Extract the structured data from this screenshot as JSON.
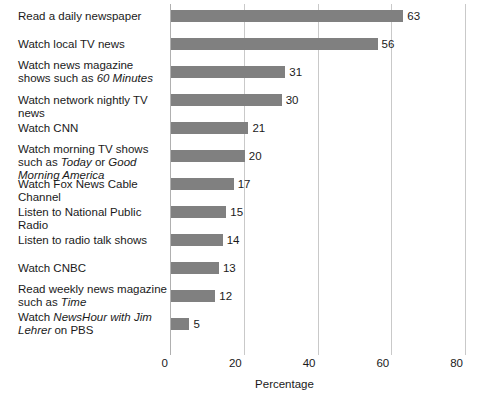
{
  "chart_data": {
    "type": "bar",
    "orientation": "horizontal",
    "title": "",
    "xlabel": "Percentage",
    "ylabel": "",
    "xlim": [
      0,
      80
    ],
    "xticks": [
      0,
      20,
      40,
      60,
      80
    ],
    "grid": true,
    "legend": false,
    "bar_color": "#808080",
    "categories": [
      "Read a daily newspaper",
      "Watch local TV news",
      "Watch news magazine shows such as 60 Minutes",
      "Watch network nightly TV news",
      "Watch CNN",
      "Watch morning TV shows such as Today or Good Morning America",
      "Watch Fox News Cable Channel",
      "Listen to National Public Radio",
      "Listen to radio talk shows",
      "Watch CNBC",
      "Read weekly news magazine such as Time",
      "Watch NewsHour with Jim Lehrer on PBS"
    ],
    "values": [
      63,
      56,
      31,
      30,
      21,
      20,
      17,
      15,
      14,
      13,
      12,
      5
    ],
    "bars": [
      {
        "value": 63,
        "value_label": "63",
        "label_html": "Read a daily newspaper",
        "lines": 1
      },
      {
        "value": 56,
        "value_label": "56",
        "label_html": "Watch local TV news",
        "lines": 1
      },
      {
        "value": 31,
        "value_label": "31",
        "label_html": "Watch news magazine shows such as <em>60 Minutes</em>",
        "lines": 2
      },
      {
        "value": 30,
        "value_label": "30",
        "label_html": "Watch network nightly TV news",
        "lines": 1
      },
      {
        "value": 21,
        "value_label": "21",
        "label_html": "Watch CNN",
        "lines": 1
      },
      {
        "value": 20,
        "value_label": "20",
        "label_html": "Watch morning TV shows such as <em>Today</em> or <em>Good Morning America</em>",
        "lines": 2
      },
      {
        "value": 17,
        "value_label": "17",
        "label_html": "Watch Fox News Cable Channel",
        "lines": 1
      },
      {
        "value": 15,
        "value_label": "15",
        "label_html": "Listen to National Public Radio",
        "lines": 1
      },
      {
        "value": 14,
        "value_label": "14",
        "label_html": "Listen to radio talk shows",
        "lines": 1
      },
      {
        "value": 13,
        "value_label": "13",
        "label_html": "Watch CNBC",
        "lines": 1
      },
      {
        "value": 12,
        "value_label": "12",
        "label_html": "Read weekly news magazine such as <em>Time</em>",
        "lines": 2
      },
      {
        "value": 5,
        "value_label": "5",
        "label_html": "Watch <em>NewsHour with Jim Lehrer</em> on PBS",
        "lines": 2
      }
    ],
    "tick_labels": [
      "0",
      "20",
      "40",
      "60",
      "80"
    ]
  }
}
